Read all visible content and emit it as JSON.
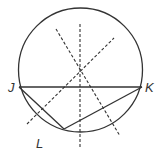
{
  "diagram": {
    "type": "geometry-circle-construction",
    "colors": {
      "stroke": "#333333",
      "background": "#ffffff"
    },
    "circle": {
      "cx": 80.5,
      "cy": 70,
      "r": 62
    },
    "points": {
      "J": {
        "x": 19,
        "y": 87,
        "label": "J"
      },
      "K": {
        "x": 142,
        "y": 87,
        "label": "K"
      },
      "L": {
        "x": 64,
        "y": 129,
        "label": "L"
      }
    },
    "solid_segments": [
      {
        "from": "J",
        "to": "K"
      },
      {
        "from": "J",
        "to": "L"
      },
      {
        "from": "L",
        "to": "K"
      }
    ],
    "dashed_lines": [
      {
        "name": "perpendicular-bisector-vertical",
        "x1": 80,
        "y1": 24,
        "x2": 80,
        "y2": 147
      },
      {
        "name": "perpendicular-bisector-JL",
        "x1": 56,
        "y1": 29,
        "x2": 120,
        "y2": 136
      },
      {
        "name": "perpendicular-bisector-LK",
        "x1": 27,
        "y1": 124,
        "x2": 114,
        "y2": 38
      }
    ],
    "labels": {
      "J": "J",
      "K": "K",
      "L": "L"
    }
  }
}
